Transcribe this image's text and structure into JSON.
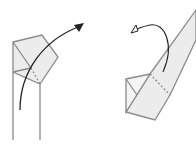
{
  "diagram": {
    "type": "origami-folding-instructions",
    "steps": [
      {
        "id": "step-1",
        "description": "folded square corner on two parallel strip edges with curved arrow pointing up-right"
      },
      {
        "id": "step-2",
        "description": "diagonal strip with small folded triangle at bottom, dashed fold line, and curved return arrow"
      }
    ],
    "colors": {
      "line": "#8a8a8a",
      "fill": "#ececec",
      "arrow": "#222222"
    }
  }
}
